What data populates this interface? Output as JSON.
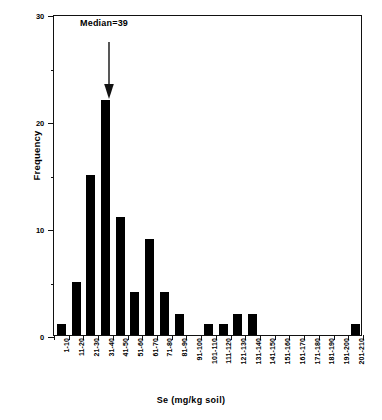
{
  "chart_data": {
    "type": "bar",
    "title": "",
    "xlabel": "Se  (mg/kg soil)",
    "ylabel": "Frequency",
    "ylim": [
      0,
      30
    ],
    "yticks": [
      0,
      10,
      20,
      30
    ],
    "yticks_minor": [
      5,
      15,
      25
    ],
    "grid": false,
    "legend": "none",
    "categories": [
      "1-10",
      "11-20",
      "21-30",
      "31-40",
      "41-50",
      "51-60",
      "61-70",
      "71-80",
      "81-90",
      "91-100",
      "101-110",
      "111-120",
      "121-130",
      "131-140",
      "141-150",
      "151-160",
      "161-170",
      "171-180",
      "181-190",
      "191-200",
      "201-210"
    ],
    "values": [
      1,
      5,
      15,
      22,
      11,
      4,
      9,
      4,
      2,
      0,
      1,
      1,
      2,
      2,
      0,
      0,
      0,
      0,
      0,
      0,
      1
    ],
    "annotations": [
      {
        "name": "median-marker",
        "text": "Median=39",
        "points_to_category": "31-40",
        "arrow": "down"
      }
    ],
    "bar_color": "#000000",
    "axis_color": "#111111"
  },
  "axis": {
    "y_tick_labels": [
      "0",
      "10",
      "20",
      "30"
    ],
    "y_title": "Frequency",
    "x_title": "Se  (mg/kg soil)"
  },
  "median_label": "Median=39"
}
